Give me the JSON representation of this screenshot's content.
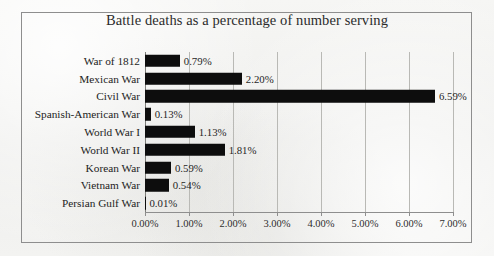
{
  "chart_data": {
    "type": "bar",
    "orientation": "horizontal",
    "title": "Battle deaths as a percentage of number serving",
    "xlabel": "",
    "ylabel": "",
    "xlim": [
      0,
      7
    ],
    "grid": true,
    "legend": false,
    "value_suffix": "%",
    "categories": [
      "War of 1812",
      "Mexican War",
      "Civil War",
      "Spanish-American War",
      "World War I",
      "World War II",
      "Korean War",
      "Vietnam War",
      "Persian Gulf War"
    ],
    "values": [
      0.79,
      2.2,
      6.59,
      0.13,
      1.13,
      1.81,
      0.59,
      0.54,
      0.01
    ],
    "value_labels": [
      "0.79%",
      "2.20%",
      "6.59%",
      "0.13%",
      "1.13%",
      "1.81%",
      "0.59%",
      "0.54%",
      "0.01%"
    ],
    "xticks": [
      0,
      1,
      2,
      3,
      4,
      5,
      6,
      7
    ],
    "xtick_labels": [
      "0.00%",
      "1.00%",
      "2.00%",
      "3.00%",
      "4.00%",
      "5.00%",
      "6.00%",
      "7.00%"
    ],
    "colors": {
      "bar": "#0d0d0d",
      "gridline": "#b9b9b5",
      "axis": "#8e8e8e",
      "text": "#232323",
      "background": "#f2f2f0",
      "frame": "#8e8e8e"
    }
  }
}
